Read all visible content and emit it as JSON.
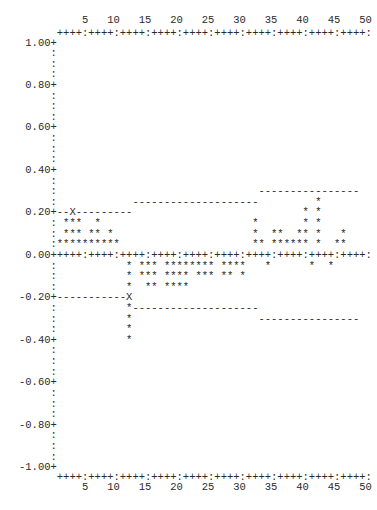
{
  "chart_data": {
    "type": "scatter",
    "title": "",
    "xlabel": "",
    "ylabel": "",
    "xlim": [
      1,
      50
    ],
    "ylim": [
      -1.0,
      1.0
    ],
    "x_tick_labels": [
      "5",
      "10",
      "15",
      "20",
      "25",
      "30",
      "35",
      "40",
      "45",
      "50"
    ],
    "y_tick_labels": [
      "1.00",
      "0.80",
      "0.60",
      "0.40",
      "0.20",
      "0.00",
      "-0.20",
      "-0.40",
      "-0.60",
      "-0.80",
      "-1.00"
    ],
    "y_step": 0.05,
    "grid": false,
    "legend": null,
    "axis_rule": "++++:++++:++++:++++:++++:++++:++++:++++:++++:++++:",
    "series": [
      {
        "name": "autocorrelation",
        "marker": "*",
        "points": [
          {
            "y": 0.25,
            "x": [
              42
            ]
          },
          {
            "y": 0.2,
            "x": [
              40,
              42
            ]
          },
          {
            "y": 0.15,
            "x": [
              2,
              3,
              4,
              7,
              32,
              40,
              42
            ]
          },
          {
            "y": 0.1,
            "x": [
              2,
              3,
              4,
              6,
              7,
              9,
              32,
              35,
              36,
              39,
              40,
              42,
              46
            ]
          },
          {
            "y": 0.05,
            "x": [
              1,
              2,
              3,
              4,
              5,
              6,
              7,
              8,
              9,
              10,
              32,
              33,
              35,
              36,
              37,
              38,
              39,
              40,
              42,
              45,
              46
            ]
          },
          {
            "y": -0.05,
            "x": [
              12,
              14,
              15,
              16,
              18,
              19,
              20,
              21,
              22,
              23,
              24,
              25,
              27,
              28,
              29,
              30,
              34,
              41,
              44
            ]
          },
          {
            "y": -0.1,
            "x": [
              12,
              14,
              15,
              16,
              18,
              19,
              20,
              21,
              23,
              24,
              25,
              27,
              28,
              30
            ]
          },
          {
            "y": -0.15,
            "x": [
              12,
              15,
              16,
              18,
              19,
              20,
              21
            ]
          },
          {
            "y": -0.2,
            "x": [
              12
            ],
            "marker": "X"
          },
          {
            "y": -0.25,
            "x": [
              12
            ]
          },
          {
            "y": -0.3,
            "x": [
              12
            ]
          },
          {
            "y": -0.35,
            "x": [
              12
            ]
          },
          {
            "y": -0.4,
            "x": [
              12
            ]
          }
        ]
      },
      {
        "name": "upper confidence limit",
        "marker": "-",
        "segments": [
          {
            "y": 0.2,
            "x_from": 1,
            "x_to": 12,
            "marker_at": {
              "x": 3,
              "char": "X"
            }
          },
          {
            "y": 0.25,
            "x_from": 13,
            "x_to": 32
          },
          {
            "y": 0.3,
            "x_from": 33,
            "x_to": 48
          }
        ]
      },
      {
        "name": "lower confidence limit",
        "marker": "-",
        "segments": [
          {
            "y": -0.2,
            "x_from": 1,
            "x_to": 11
          },
          {
            "y": -0.25,
            "x_from": 13,
            "x_to": 32
          },
          {
            "y": -0.3,
            "x_from": 33,
            "x_to": 48
          }
        ]
      }
    ]
  }
}
